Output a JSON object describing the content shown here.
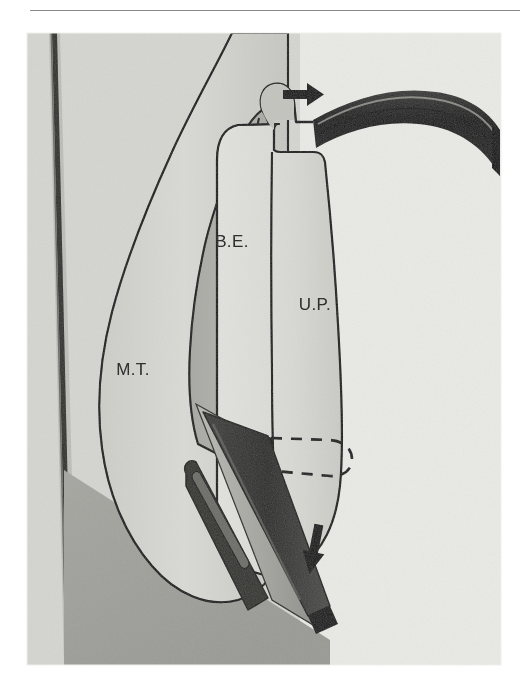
{
  "figure": {
    "domain_kind": "anatomical-surgical-diagram",
    "title_rule_visible": true,
    "background_color": "#ffffff",
    "panel": {
      "x": 27,
      "y": 33,
      "width": 474,
      "height": 632,
      "fill_color": "#d6d6d2"
    },
    "palette": {
      "paper": "#ffffff",
      "mucosa_light": "#d8d8d4",
      "mucosa_mid": "#c9c9c4",
      "mucosa_dark": "#a9a9a4",
      "tissue_shadow": "#9a9a95",
      "instrument_dark": "#1b1b1b",
      "instrument_mid": "#4a4a48",
      "outline": "#111111",
      "label_text": "#141414"
    },
    "labels": [
      {
        "id": "be",
        "text": "B.E.",
        "x": 232,
        "y": 247,
        "meaning": "bulla ethmoidalis"
      },
      {
        "id": "up",
        "text": "U.P.",
        "x": 315,
        "y": 310,
        "meaning": "uncinate process"
      },
      {
        "id": "mt",
        "text": "M.T.",
        "x": 133,
        "y": 375,
        "meaning": "middle turbinate"
      }
    ],
    "annotations": [
      {
        "id": "arrow-top",
        "name": "arrow-right",
        "direction": "right",
        "x": 283,
        "y": 95,
        "length": 34,
        "meaning": "direction of probe advancement"
      },
      {
        "id": "arrow-bottom",
        "name": "arrow-down",
        "direction": "down",
        "x": 313,
        "y": 538,
        "length": 38,
        "meaning": "direction of instrument withdrawal"
      },
      {
        "id": "dashed-tip",
        "name": "dashed-hidden-outline",
        "style": "dashed",
        "meaning": "hidden tip of instrument behind uncinate process"
      }
    ],
    "structures": [
      {
        "id": "septum",
        "name": "nasal-septum",
        "shading": "thin dark vertical band at left"
      },
      {
        "id": "middle-turbinate",
        "name": "middle-turbinate",
        "label": "M.T."
      },
      {
        "id": "bulla-ethmoidalis",
        "name": "bulla-ethmoidalis",
        "label": "B.E."
      },
      {
        "id": "uncinate-process",
        "name": "uncinate-process",
        "label": "U.P."
      },
      {
        "id": "nasal-floor",
        "name": "nasal-floor",
        "shading": "diagonal darker wedge lower left"
      }
    ],
    "instruments": [
      {
        "id": "curved-probe",
        "name": "curved-seeker-probe",
        "color": "#1b1b1b",
        "entry": "from upper right, tip at top of uncinate process"
      },
      {
        "id": "cannula",
        "name": "suction-cannula",
        "color": "#3a3a38",
        "entry": "from lower right, through infundibulum"
      },
      {
        "id": "inner-rod",
        "name": "inner-rod",
        "color": "#2a2a28",
        "entry": "parallel to cannula, with side port slot"
      }
    ]
  }
}
